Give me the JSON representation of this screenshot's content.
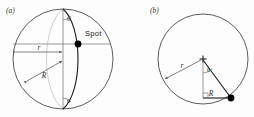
{
  "figure": {
    "background_color": "#fdfdfd",
    "line_color": "#4a4a4a",
    "accent_color": "#000000",
    "width": 254,
    "height": 117
  },
  "panel_a": {
    "caption": "(a)",
    "spot_label": "Spot",
    "radius_small_label": "r",
    "radius_large_label": "R",
    "angle_top_label": "θ",
    "angle_bottom_label": "θ",
    "circle": {
      "cx": 63,
      "cy": 59,
      "r": 50
    },
    "spot_point": {
      "x": 78,
      "y": 44
    }
  },
  "panel_b": {
    "caption": "(b)",
    "radius_small_label": "r",
    "radius_large_label": "R",
    "angle_label": "θ",
    "circle": {
      "cx": 203,
      "cy": 59,
      "r": 45
    },
    "center_point": {
      "x": 203,
      "y": 59
    },
    "spot_point": {
      "x": 231,
      "y": 98
    }
  }
}
